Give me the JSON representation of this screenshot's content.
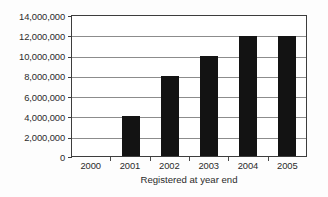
{
  "chart_data": {
    "type": "bar",
    "title": "",
    "subtitle": "",
    "xlabel": "Registered at year end",
    "ylabel": "",
    "categories": [
      "2000",
      "2001",
      "2002",
      "2003",
      "2004",
      "2005"
    ],
    "values": [
      0,
      4000000,
      8000000,
      10000000,
      12000000,
      12000000
    ],
    "series": [
      {
        "name": "Registered at year end",
        "values": [
          0,
          4000000,
          8000000,
          10000000,
          12000000,
          12000000
        ]
      }
    ],
    "ylim": [
      0,
      14000000
    ],
    "ytick_values": [
      0,
      2000000,
      4000000,
      6000000,
      8000000,
      10000000,
      12000000,
      14000000
    ],
    "ytick_labels": [
      "14,000,000",
      "12,000,000",
      "10,000,000",
      "8,000,000",
      "6,000,000",
      "4,000,000",
      "2,000,000",
      "0"
    ],
    "grid": true,
    "grid_axis": "y",
    "legend": false,
    "legend_position": "none",
    "bar_color": "#131313",
    "grid_color": "#8c8c8c",
    "axis_color": "#3d3d3d",
    "background_color": "#ffffff",
    "annotations": []
  }
}
